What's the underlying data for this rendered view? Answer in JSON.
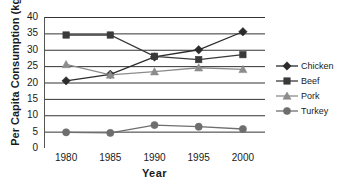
{
  "chart_data": {
    "type": "line",
    "title": "",
    "xlabel": "Year",
    "ylabel": "Per Capita Consumption (kg)",
    "x": [
      1980,
      1985,
      1990,
      1995,
      2000
    ],
    "xticklabels": [
      "1980",
      "1985",
      "1990",
      "1995",
      "2000"
    ],
    "yticklabels": [
      "0",
      "5",
      "10",
      "15",
      "20",
      "25",
      "30",
      "35",
      "40"
    ],
    "ylim": [
      0,
      40
    ],
    "ytick_step": 5,
    "grid": "horizontal",
    "legend_position": "right",
    "series": [
      {
        "name": "Chicken",
        "marker": "diamond",
        "color": "#2b2b2b",
        "values": [
          20.5,
          22.5,
          27.8,
          30.0,
          35.5
        ]
      },
      {
        "name": "Beef",
        "marker": "square",
        "color": "#3a3a3a",
        "values": [
          34.5,
          34.5,
          28.0,
          27.0,
          28.5
        ]
      },
      {
        "name": "Pork",
        "marker": "triangle",
        "color": "#8c8c8c",
        "values": [
          25.5,
          22.3,
          23.3,
          24.5,
          24.0
        ]
      },
      {
        "name": "Turkey",
        "marker": "circle",
        "color": "#6e6e6e",
        "values": [
          4.8,
          4.6,
          7.0,
          6.5,
          5.8
        ]
      }
    ]
  },
  "legend": {
    "items": [
      {
        "label": "Chicken"
      },
      {
        "label": "Beef"
      },
      {
        "label": "Pork"
      },
      {
        "label": "Turkey"
      }
    ]
  },
  "axes": {
    "y_title": "Per Capita Consumption (kg)",
    "x_title": "Year"
  }
}
